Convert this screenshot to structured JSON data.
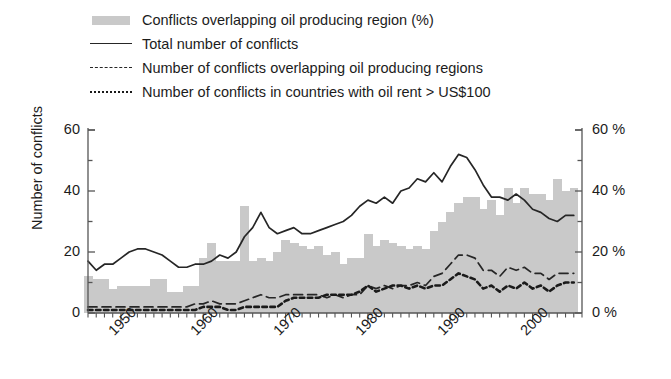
{
  "figure": {
    "background": "#ffffff",
    "bar_color": "#c9c9c9",
    "line_color": "#262626"
  },
  "legend": {
    "position": "top-left",
    "items": [
      {
        "marker": "bar-swatch",
        "label": "Conflicts overlapping oil producing region (%)"
      },
      {
        "marker": "solid-line",
        "label": "Total number of conflicts"
      },
      {
        "marker": "dashed-line",
        "label": "Number of conflicts overlapping oil producing regions"
      },
      {
        "marker": "dotted-line",
        "label": "Number of conflicts in countries with oil rent > US$100"
      }
    ]
  },
  "axes": {
    "left": {
      "title": "Number of conflicts",
      "ticks": [
        "0",
        "20",
        "40",
        "60"
      ],
      "tick_values": [
        0,
        20,
        40,
        60
      ],
      "range": [
        0,
        60
      ]
    },
    "right": {
      "title": "",
      "ticks": [
        "0 %",
        "20 %",
        "40 %",
        "60 %"
      ],
      "tick_values": [
        0,
        20,
        40,
        60
      ],
      "range": [
        0,
        60
      ]
    },
    "bottom": {
      "title": "",
      "ticks": [
        "1950",
        "1960",
        "1970",
        "1980",
        "1990",
        "2000"
      ],
      "tick_values": [
        1950,
        1960,
        1970,
        1980,
        1990,
        2000
      ],
      "range": [
        1946,
        2006
      ]
    }
  },
  "chart_data": {
    "type": "bar",
    "title": "",
    "subtitle": "",
    "xlabel": "",
    "ylabel": "Number of conflicts",
    "y2label": "",
    "xlim": [
      1946,
      2006
    ],
    "ylim": [
      0,
      60
    ],
    "y2lim": [
      0,
      60
    ],
    "grid": false,
    "legend_position": "top-left",
    "x": [
      1946,
      1947,
      1948,
      1949,
      1950,
      1951,
      1952,
      1953,
      1954,
      1955,
      1956,
      1957,
      1958,
      1959,
      1960,
      1961,
      1962,
      1963,
      1964,
      1965,
      1966,
      1967,
      1968,
      1969,
      1970,
      1971,
      1972,
      1973,
      1974,
      1975,
      1976,
      1977,
      1978,
      1979,
      1980,
      1981,
      1982,
      1983,
      1984,
      1985,
      1986,
      1987,
      1988,
      1989,
      1990,
      1991,
      1992,
      1993,
      1994,
      1995,
      1996,
      1997,
      1998,
      1999,
      2000,
      2001,
      2002,
      2003,
      2004,
      2005
    ],
    "series": [
      {
        "name": "Conflicts overlapping oil producing region (%)",
        "type": "bar",
        "axis": "right",
        "unit": "%",
        "color": "#c9c9c9",
        "values": [
          12,
          11,
          11,
          8,
          9,
          9,
          9,
          9,
          11,
          11,
          7,
          7,
          9,
          9,
          18,
          23,
          17,
          17,
          17,
          35,
          17,
          18,
          17,
          20,
          24,
          23,
          22,
          21,
          22,
          19,
          20,
          16,
          18,
          18,
          26,
          22,
          24,
          23,
          22,
          21,
          22,
          21,
          27,
          30,
          33,
          36,
          38,
          38,
          34,
          37,
          32,
          41,
          36,
          41,
          39,
          39,
          37,
          44,
          40,
          41
        ]
      },
      {
        "name": "Total number of conflicts",
        "type": "line",
        "axis": "left",
        "style": "solid",
        "color": "#262626",
        "values": [
          17,
          14,
          16,
          16,
          18,
          20,
          21,
          21,
          20,
          19,
          17,
          15,
          15,
          16,
          16,
          17,
          19,
          18,
          20,
          25,
          28,
          33,
          28,
          26,
          27,
          28,
          26,
          26,
          27,
          28,
          29,
          30,
          32,
          35,
          37,
          36,
          38,
          36,
          40,
          41,
          44,
          43,
          46,
          43,
          48,
          52,
          51,
          47,
          42,
          38,
          38,
          37,
          39,
          37,
          34,
          33,
          31,
          30,
          32,
          32
        ]
      },
      {
        "name": "Number of conflicts overlapping oil producing regions",
        "type": "line",
        "axis": "left",
        "style": "dashed",
        "color": "#262626",
        "values": [
          2,
          2,
          2,
          2,
          2,
          2,
          2,
          2,
          2,
          2,
          2,
          2,
          2,
          3,
          3,
          4,
          3,
          3,
          3,
          4,
          5,
          6,
          5,
          5,
          6,
          6,
          6,
          6,
          6,
          5,
          6,
          5,
          6,
          6,
          9,
          8,
          9,
          8,
          9,
          9,
          10,
          9,
          12,
          13,
          16,
          19,
          19,
          18,
          14,
          14,
          12,
          15,
          14,
          15,
          13,
          13,
          11,
          13,
          13,
          13
        ]
      },
      {
        "name": "Number of conflicts in countries with oil rent > US$100",
        "type": "line",
        "axis": "left",
        "style": "dotted",
        "color": "#1a1a1a",
        "values": [
          1,
          1,
          1,
          1,
          1,
          1,
          1,
          1,
          1,
          1,
          1,
          1,
          1,
          1,
          2,
          2,
          2,
          1,
          1,
          2,
          2,
          2,
          2,
          2,
          4,
          5,
          5,
          5,
          5,
          6,
          6,
          6,
          6,
          7,
          9,
          7,
          8,
          9,
          9,
          8,
          9,
          8,
          9,
          9,
          11,
          13,
          12,
          11,
          8,
          9,
          7,
          9,
          8,
          10,
          8,
          9,
          7,
          9,
          10,
          10
        ]
      }
    ]
  }
}
